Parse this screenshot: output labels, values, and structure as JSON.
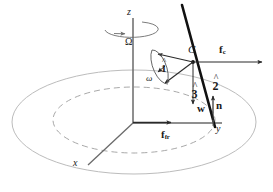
{
  "figure": {
    "background_color": "#ffffff",
    "width": 273,
    "height": 192,
    "colors": {
      "ink": "#1a1a1a",
      "axis": "#555555",
      "disk_outline": "#b9b9b9",
      "orbit_dashed": "#9a9a9a",
      "body_line": "#111111",
      "vector": "#3a3a3a"
    }
  },
  "labels": {
    "z_axis": "z",
    "omega_capital": "Ω",
    "omega_small": "ω",
    "x_axis": "x",
    "y_axis": "y",
    "point_c": "C",
    "unit_1": "1",
    "unit_2": "2",
    "unit_3": "3",
    "force_coriolis": "f",
    "force_coriolis_sub": "c",
    "force_friction": "f",
    "force_friction_sub": "fr",
    "weight": "w",
    "normal": "n"
  },
  "elements": {
    "disk": "solid-light-gray-ellipse",
    "orbit": "dashed-gray-ellipse",
    "spin_arrow": "omega-rotation-ellipse-arrow-about-z",
    "body": "thick-black-inclined-line-through-C",
    "axes": [
      "z-vertical-up",
      "y-horizontal-right",
      "x-lower-left-diagonal"
    ],
    "vectors": [
      {
        "name": "unit-vector-1",
        "from": "C",
        "direction": "upper-left"
      },
      {
        "name": "unit-vector-2",
        "from": "C",
        "direction": "down-right-along-body"
      },
      {
        "name": "unit-vector-3",
        "from": "C",
        "direction": "lower-left"
      },
      {
        "name": "omega-small",
        "from": "C",
        "direction": "left-down"
      },
      {
        "name": "coriolis-force",
        "from": "C",
        "direction": "right-horizontal"
      },
      {
        "name": "weight",
        "from": "C",
        "direction": "down-vertical"
      },
      {
        "name": "normal-force",
        "from": "contact-point",
        "direction": "up-vertical"
      },
      {
        "name": "friction-force",
        "from": "origin",
        "direction": "right-along-y"
      }
    ]
  }
}
